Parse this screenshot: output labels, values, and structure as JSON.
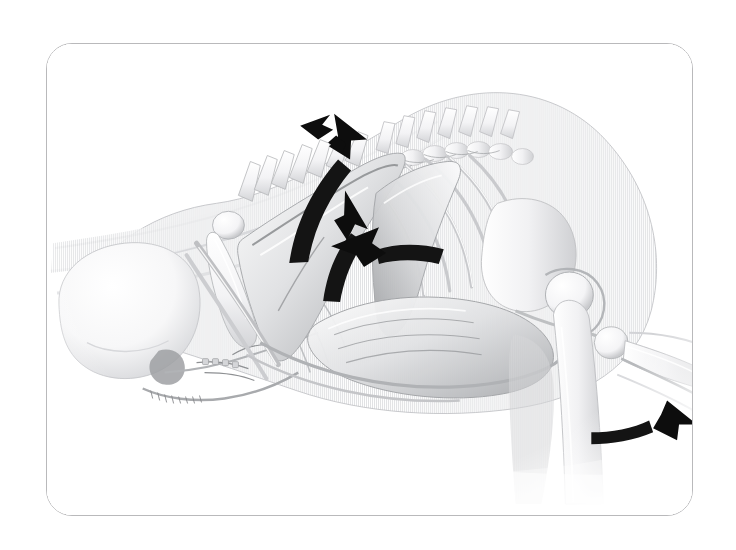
{
  "figure": {
    "kind": "anatomical-illustration",
    "subject": "quadruped axial and appendicular skeleton with superficial musculature, left lateral view",
    "style": "grayscale stipple / vertical-line halftone rendering",
    "background_color": "#ffffff",
    "frame": {
      "border_color": "#b9b9bb",
      "border_width_px": 1,
      "corner_radius_px": 26,
      "x": 46,
      "y": 43,
      "width": 647,
      "height": 473
    },
    "ink_colors": {
      "arrow_fill": "#0d0d0d",
      "bone_light": "#fbfbfc",
      "bone_mid": "#e3e4e6",
      "muscle_shadow": "#9a9c9e",
      "deep_shadow": "#6a6c6f",
      "outline": "#8d8f92"
    }
  },
  "anatomy_parts": [
    {
      "id": "skull",
      "label": "Cranium"
    },
    {
      "id": "mandible",
      "label": "Mandible"
    },
    {
      "id": "hyoid",
      "label": "Hyoid apparatus"
    },
    {
      "id": "cervical-spine",
      "label": "Cervical vertebrae"
    },
    {
      "id": "thoracic-spine",
      "label": "Thoracic vertebrae"
    },
    {
      "id": "lumbar-spine",
      "label": "Lumbar vertebrae"
    },
    {
      "id": "ribcage",
      "label": "Rib cage"
    },
    {
      "id": "sternum",
      "label": "Sternum"
    },
    {
      "id": "scapula",
      "label": "Scapula"
    },
    {
      "id": "humerus",
      "label": "Humerus"
    },
    {
      "id": "forelimb",
      "label": "Forelimb (radius / ulna)"
    },
    {
      "id": "pelvis",
      "label": "Pelvis / ilium"
    },
    {
      "id": "femoral-head",
      "label": "Femoral head"
    },
    {
      "id": "femur",
      "label": "Femur"
    },
    {
      "id": "tibia",
      "label": "Tibia"
    },
    {
      "id": "neck-muscle",
      "label": "Cervical musculature"
    },
    {
      "id": "shoulder-muscle",
      "label": "Shoulder girdle musculature"
    },
    {
      "id": "abdominal-muscle",
      "label": "Abdominal musculature"
    }
  ],
  "arrows": [
    {
      "id": "arrow-scapula-upper",
      "name": "upper scapular traction arrow",
      "direction": "up-right",
      "style": "small solid arrowhead",
      "x": 300,
      "y": 130,
      "length": 34,
      "angle_deg": -28
    },
    {
      "id": "arrow-scapula-sweep",
      "name": "scapular sweep arrow",
      "direction": "curving upward to the right",
      "style": "tapered curved shaft with solid arrowhead",
      "x": 320,
      "y": 200,
      "length": 96,
      "angle_deg": -55
    },
    {
      "id": "arrow-thorax-lift",
      "name": "thoracic lift arrow",
      "direction": "curving upward",
      "style": "tapered curved shaft with solid arrowhead",
      "x": 338,
      "y": 270,
      "length": 76,
      "angle_deg": -72
    },
    {
      "id": "arrow-abdominal-pull",
      "name": "abdominal pull arrow",
      "direction": "curving to the left",
      "style": "tapered curved shaft with solid arrowhead",
      "x": 430,
      "y": 258,
      "length": 88,
      "angle_deg": 182
    },
    {
      "id": "arrow-hindlimb",
      "name": "hindlimb extension arrow",
      "direction": "up-right",
      "style": "tapered curved shaft with solid arrowhead",
      "x": 615,
      "y": 424,
      "length": 68,
      "angle_deg": -22
    }
  ]
}
